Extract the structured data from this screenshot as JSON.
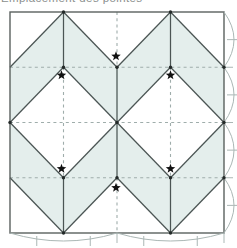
{
  "caption": {
    "text": "Emplacement des pointes"
  },
  "diagram": {
    "colors": {
      "background": "#ffffff",
      "shade": "#e4eeec",
      "solid_line": "#4b5554",
      "border_line": "#5b615f",
      "dashed_line": "#9fadab",
      "arc_line": "#abb7b5",
      "star": "#111111",
      "dot": "#242a29"
    },
    "grid": {
      "x0": 10,
      "y0": 12,
      "x1": 224,
      "y1": 233,
      "cols": 4,
      "rows": 4
    },
    "shaded_polygons": [
      [
        [
          1,
          0
        ],
        [
          0,
          1
        ],
        [
          0,
          2
        ],
        [
          1,
          1
        ]
      ],
      [
        [
          1,
          0
        ],
        [
          2,
          1
        ],
        [
          2,
          2
        ],
        [
          1,
          1
        ]
      ],
      [
        [
          3,
          0
        ],
        [
          2,
          1
        ],
        [
          2,
          2
        ],
        [
          3,
          1
        ]
      ],
      [
        [
          3,
          0
        ],
        [
          4,
          1
        ],
        [
          4,
          2
        ],
        [
          3,
          1
        ]
      ],
      [
        [
          1,
          4
        ],
        [
          0,
          3
        ],
        [
          0,
          2
        ],
        [
          1,
          3
        ]
      ],
      [
        [
          1,
          4
        ],
        [
          2,
          3
        ],
        [
          2,
          2
        ],
        [
          1,
          3
        ]
      ],
      [
        [
          3,
          4
        ],
        [
          2,
          3
        ],
        [
          2,
          2
        ],
        [
          3,
          3
        ]
      ],
      [
        [
          3,
          4
        ],
        [
          4,
          3
        ],
        [
          4,
          2
        ],
        [
          3,
          3
        ]
      ]
    ],
    "dashed_segments": [
      [
        [
          0,
          1
        ],
        [
          4,
          1
        ]
      ],
      [
        [
          0,
          2
        ],
        [
          4,
          2
        ]
      ],
      [
        [
          0,
          3
        ],
        [
          4,
          3
        ]
      ],
      [
        [
          1,
          1
        ],
        [
          1,
          3
        ]
      ],
      [
        [
          3,
          1
        ],
        [
          3,
          3
        ]
      ],
      [
        [
          2,
          0
        ],
        [
          2,
          1
        ]
      ],
      [
        [
          2,
          3
        ],
        [
          2,
          4
        ]
      ]
    ],
    "solid_segments": [
      [
        [
          1,
          0
        ],
        [
          1,
          1
        ]
      ],
      [
        [
          3,
          0
        ],
        [
          3,
          1
        ]
      ],
      [
        [
          2,
          1
        ],
        [
          2,
          3
        ]
      ],
      [
        [
          1,
          3
        ],
        [
          1,
          4
        ]
      ],
      [
        [
          3,
          3
        ],
        [
          3,
          4
        ]
      ],
      [
        [
          1,
          0
        ],
        [
          0,
          1
        ]
      ],
      [
        [
          1,
          0
        ],
        [
          2,
          1
        ]
      ],
      [
        [
          3,
          0
        ],
        [
          2,
          1
        ]
      ],
      [
        [
          3,
          0
        ],
        [
          4,
          1
        ]
      ],
      [
        [
          1,
          1
        ],
        [
          0,
          2
        ]
      ],
      [
        [
          0,
          2
        ],
        [
          1,
          3
        ]
      ],
      [
        [
          1,
          1
        ],
        [
          2,
          2
        ]
      ],
      [
        [
          2,
          2
        ],
        [
          1,
          3
        ]
      ],
      [
        [
          3,
          1
        ],
        [
          2,
          2
        ]
      ],
      [
        [
          2,
          2
        ],
        [
          3,
          3
        ]
      ],
      [
        [
          3,
          1
        ],
        [
          4,
          2
        ]
      ],
      [
        [
          4,
          2
        ],
        [
          3,
          3
        ]
      ],
      [
        [
          1,
          4
        ],
        [
          0,
          3
        ]
      ],
      [
        [
          1,
          4
        ],
        [
          2,
          3
        ]
      ],
      [
        [
          3,
          4
        ],
        [
          2,
          3
        ]
      ],
      [
        [
          3,
          4
        ],
        [
          4,
          3
        ]
      ]
    ],
    "dots": [
      [
        1,
        0
      ],
      [
        3,
        0
      ],
      [
        2,
        1
      ],
      [
        1,
        1
      ],
      [
        3,
        1
      ],
      [
        4,
        1
      ],
      [
        0,
        2
      ],
      [
        2,
        2
      ],
      [
        4,
        2
      ],
      [
        1,
        3
      ],
      [
        3,
        3
      ],
      [
        2,
        3
      ],
      [
        4,
        3
      ],
      [
        1,
        4
      ],
      [
        3,
        4
      ]
    ],
    "stars": [
      {
        "gx": 2,
        "gy": 1,
        "dx": -1,
        "dy": -11
      },
      {
        "gx": 1,
        "gy": 1,
        "dx": -2,
        "dy": 8
      },
      {
        "gx": 3,
        "gy": 1,
        "dx": 0,
        "dy": 8
      },
      {
        "gx": 1,
        "gy": 3,
        "dx": -2,
        "dy": -9
      },
      {
        "gx": 3,
        "gy": 3,
        "dx": 0,
        "dy": -9
      },
      {
        "gx": 2,
        "gy": 3,
        "dx": -1,
        "dy": 10
      }
    ],
    "star_size": {
      "outer": 5,
      "inner": 2.1
    },
    "right_arcs": {
      "spans_u": [
        [
          0,
          1
        ],
        [
          1,
          2
        ],
        [
          2,
          3
        ],
        [
          3,
          4
        ]
      ],
      "bulge_px": 10
    },
    "bottom_arcs": {
      "spans_u": [
        [
          0,
          2
        ],
        [
          2,
          4
        ]
      ],
      "bulge_px": 8
    },
    "right_ticks_eighths_u": [
      0.5,
      1.5,
      2.5,
      3.5
    ],
    "right_ticks_quarters_u": [
      1,
      2,
      3
    ],
    "bottom_ticks_eighths_u": [
      0.5,
      1.5,
      2.5,
      3.5
    ],
    "bottom_ticks_extra_u": [
      2,
      4
    ]
  }
}
